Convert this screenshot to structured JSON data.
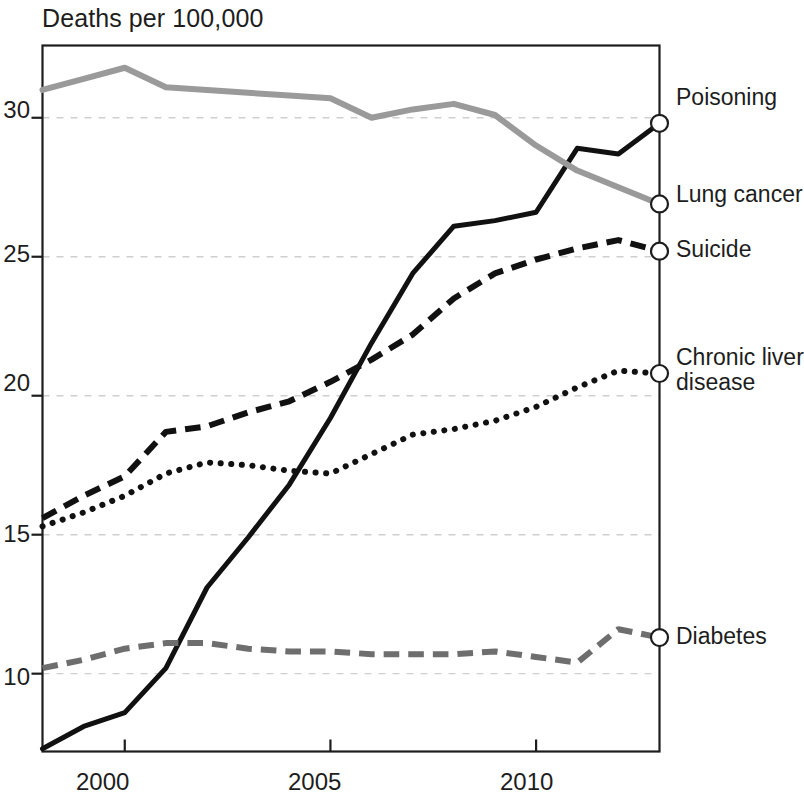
{
  "chart_data": {
    "type": "line",
    "title": "Deaths per 100,000",
    "xlabel": "",
    "ylabel": "Deaths per 100,000",
    "xlim": [
      1998,
      2013
    ],
    "ylim": [
      7.2,
      32.6
    ],
    "x_ticks": [
      "2000",
      "2005",
      "2010"
    ],
    "x_tick_values": [
      2000,
      2005,
      2010
    ],
    "y_ticks": [
      "10",
      "15",
      "20",
      "25",
      "30"
    ],
    "y_tick_values": [
      10,
      15,
      20,
      25,
      30
    ],
    "grid": "horizontal-dashed",
    "legend_position": "right-inline-end-labels",
    "end_markers": "open-circle",
    "x": [
      1998,
      1999,
      2000,
      2001,
      2002,
      2003,
      2004,
      2005,
      2006,
      2007,
      2008,
      2009,
      2010,
      2011,
      2012,
      2013
    ],
    "series": [
      {
        "name": "Poisoning",
        "style": "solid",
        "color": "#111111",
        "width": 5,
        "values": [
          7.3,
          8.1,
          8.6,
          10.2,
          13.1,
          14.9,
          16.8,
          19.2,
          21.9,
          24.4,
          26.1,
          26.3,
          26.6,
          28.9,
          28.7,
          29.8
        ],
        "label_x": 676,
        "label_y": 85
      },
      {
        "name": "Lung cancer",
        "style": "solid",
        "color": "#9a9a9a",
        "width": 6,
        "values": [
          31.0,
          31.4,
          31.8,
          31.1,
          31.0,
          30.9,
          30.8,
          30.7,
          30.0,
          30.3,
          30.5,
          30.1,
          29.0,
          28.1,
          27.5,
          26.9
        ],
        "label_x": 676,
        "label_y": 182
      },
      {
        "name": "Suicide",
        "style": "dashed",
        "color": "#111111",
        "width": 6,
        "values": [
          15.6,
          16.4,
          17.1,
          18.7,
          18.9,
          19.4,
          19.8,
          20.5,
          21.3,
          22.2,
          23.5,
          24.4,
          24.9,
          25.3,
          25.6,
          25.2
        ],
        "label_x": 676,
        "label_y": 237
      },
      {
        "name": "Chronic liver\ndisease",
        "name_line1": "Chronic liver",
        "name_line2": "disease",
        "style": "dotted",
        "color": "#111111",
        "width": 6,
        "values": [
          15.3,
          15.8,
          16.4,
          17.2,
          17.6,
          17.5,
          17.3,
          17.2,
          17.9,
          18.6,
          18.8,
          19.1,
          19.6,
          20.3,
          20.9,
          20.8
        ],
        "label_x": 676,
        "label_y": 345
      },
      {
        "name": "Diabetes",
        "style": "dashed",
        "color": "#6e6e6e",
        "width": 6,
        "values": [
          10.2,
          10.5,
          10.9,
          11.1,
          11.1,
          10.9,
          10.8,
          10.8,
          10.7,
          10.7,
          10.7,
          10.8,
          10.6,
          10.4,
          11.6,
          11.3
        ],
        "label_x": 676,
        "label_y": 624
      }
    ]
  },
  "axis": {
    "y_tick_labels": [
      {
        "text": "30",
        "x": 4,
        "y": 96
      },
      {
        "text": "25",
        "x": 4,
        "y": 240
      },
      {
        "text": "20",
        "x": 4,
        "y": 369
      },
      {
        "text": "15",
        "x": 4,
        "y": 520
      },
      {
        "text": "10",
        "x": 4,
        "y": 663
      }
    ],
    "x_tick_labels": [
      {
        "text": "2000",
        "x": 76,
        "y": 768
      },
      {
        "text": "2005",
        "x": 288,
        "y": 768
      },
      {
        "text": "2010",
        "x": 500,
        "y": 768
      }
    ]
  }
}
